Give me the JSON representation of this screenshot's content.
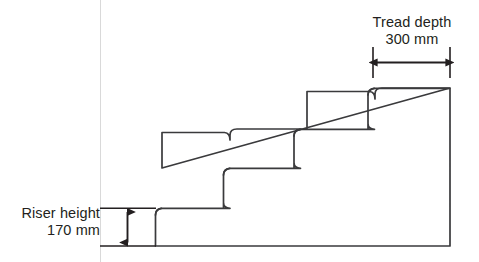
{
  "diagram": {
    "type": "technical-line-drawing",
    "colors": {
      "outline": "#3a3a3c",
      "dimension": "#231f20",
      "reference_line": "#d8d8d8",
      "background": "#ffffff",
      "text": "#231f20"
    },
    "dimensions": {
      "riser": {
        "label_line1": "Riser height",
        "label_line2": "170 mm",
        "value": 170,
        "unit": "mm",
        "orientation": "vertical",
        "arrow_style": "double-headed"
      },
      "tread": {
        "label_line1": "Tread depth",
        "label_line2": "300 mm",
        "value": 300,
        "unit": "mm",
        "orientation": "horizontal",
        "arrow_style": "double-headed"
      }
    },
    "staircase": {
      "step_count": 4,
      "nosing": "rounded-overhang",
      "direction": "ascending-left-to-right"
    }
  }
}
